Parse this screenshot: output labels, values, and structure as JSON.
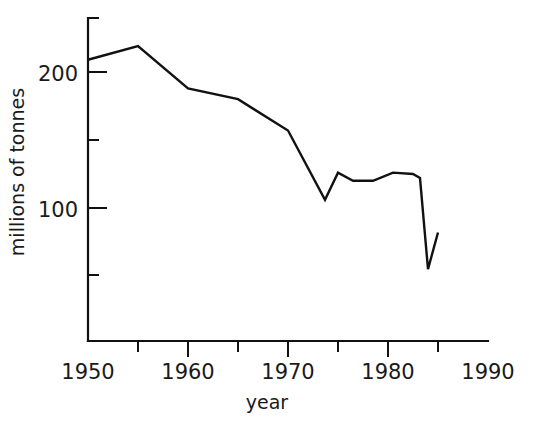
{
  "chart_data": {
    "type": "line",
    "title": "",
    "xlabel": "year",
    "ylabel": "millions of tonnes",
    "xlim": [
      1950,
      1990
    ],
    "ylim": [
      0,
      240
    ],
    "grid": false,
    "legend": null,
    "x_tick_labels": [
      "1950",
      "1960",
      "1970",
      "1980",
      "1990"
    ],
    "x_major_ticks": [
      1950,
      1960,
      1970,
      1980,
      1990
    ],
    "x_minor_ticks": [
      1955,
      1965,
      1975,
      1985
    ],
    "y_tick_labels": [
      "200",
      "100"
    ],
    "y_major_ticks": [
      200,
      100
    ],
    "y_minor_ticks": [
      240,
      150,
      50
    ],
    "series": [
      {
        "name": "catch",
        "x": [
          1950,
          1955,
          1960,
          1965,
          1970,
          1973.7,
          1975,
          1976.5,
          1978.5,
          1980.5,
          1982.5,
          1983.2,
          1984.0,
          1985.0
        ],
        "values": [
          209,
          219,
          188,
          180,
          157,
          106,
          126,
          120,
          120,
          126,
          125,
          122,
          55,
          82
        ]
      }
    ],
    "line_color": "#111111",
    "background_color": "#ffffff"
  },
  "axis_labels": {
    "x": "year",
    "y": "millions of tonnes"
  }
}
